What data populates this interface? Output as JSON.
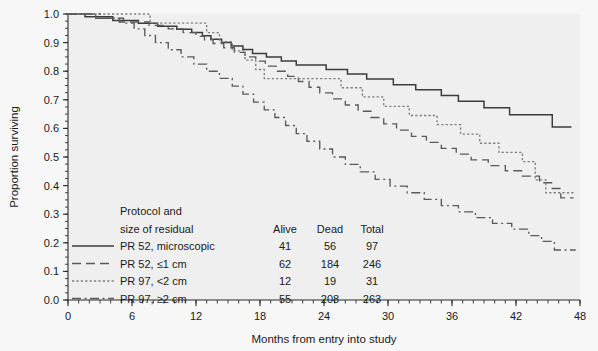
{
  "chart_data": {
    "type": "line",
    "title": "",
    "xlabel": "Months from entry into study",
    "ylabel": "Proportion surviving",
    "xlim": [
      0,
      48
    ],
    "ylim": [
      0.0,
      1.0
    ],
    "xticks": [
      0,
      6,
      12,
      18,
      24,
      30,
      36,
      42,
      48
    ],
    "xtick_labels": [
      "0",
      "6",
      "12",
      "18",
      "24",
      "30",
      "36",
      "42",
      "48"
    ],
    "x_minor_tick_interval": 1,
    "yticks": [
      0.0,
      0.1,
      0.2,
      0.3,
      0.4,
      0.5,
      0.6,
      0.7,
      0.8,
      0.9,
      1.0
    ],
    "ytick_labels": [
      "0.0",
      "0.1",
      "0.2",
      "0.3",
      "0.4",
      "0.5",
      "0.6",
      "0.7",
      "0.8",
      "0.9",
      "1.0"
    ],
    "y_minor_tick_interval": 0.025,
    "grid": false,
    "legend_position": "lower-left-inside",
    "background_color": "#f7f7f7",
    "plot_background_color": "#efefef",
    "series": [
      {
        "name": "PR 52, microscopic",
        "linestyle": "solid",
        "color": "#3c3c3c",
        "points": [
          [
            0,
            1.0
          ],
          [
            1.6,
            1.0
          ],
          [
            1.6,
            0.99
          ],
          [
            4.2,
            0.99
          ],
          [
            4.2,
            0.977
          ],
          [
            6.6,
            0.977
          ],
          [
            6.6,
            0.968
          ],
          [
            8.4,
            0.968
          ],
          [
            8.4,
            0.957
          ],
          [
            10.2,
            0.957
          ],
          [
            10.2,
            0.947
          ],
          [
            11.6,
            0.947
          ],
          [
            11.6,
            0.935
          ],
          [
            12.6,
            0.935
          ],
          [
            12.6,
            0.924
          ],
          [
            13.4,
            0.924
          ],
          [
            13.4,
            0.912
          ],
          [
            14.4,
            0.912
          ],
          [
            14.4,
            0.9
          ],
          [
            15.3,
            0.9
          ],
          [
            15.3,
            0.888
          ],
          [
            16.4,
            0.888
          ],
          [
            16.4,
            0.876
          ],
          [
            17.3,
            0.876
          ],
          [
            17.3,
            0.862
          ],
          [
            18.6,
            0.862
          ],
          [
            18.6,
            0.85
          ],
          [
            20.0,
            0.85
          ],
          [
            20.0,
            0.836
          ],
          [
            21.4,
            0.836
          ],
          [
            21.4,
            0.822
          ],
          [
            24.2,
            0.822
          ],
          [
            24.2,
            0.806
          ],
          [
            26.2,
            0.806
          ],
          [
            26.2,
            0.79
          ],
          [
            28.0,
            0.79
          ],
          [
            28.0,
            0.773
          ],
          [
            30.5,
            0.773
          ],
          [
            30.5,
            0.753
          ],
          [
            32.6,
            0.753
          ],
          [
            32.6,
            0.735
          ],
          [
            35.0,
            0.735
          ],
          [
            35.0,
            0.715
          ],
          [
            36.6,
            0.715
          ],
          [
            36.6,
            0.695
          ],
          [
            39.0,
            0.695
          ],
          [
            39.0,
            0.672
          ],
          [
            41.4,
            0.672
          ],
          [
            41.4,
            0.648
          ],
          [
            45.4,
            0.648
          ],
          [
            45.4,
            0.605
          ],
          [
            47.2,
            0.605
          ]
        ]
      },
      {
        "name": "PR 52, ≤1 cm",
        "linestyle": "dashed",
        "color": "#5a5a5a",
        "points": [
          [
            0,
            1.0
          ],
          [
            2.6,
            1.0
          ],
          [
            2.6,
            0.985
          ],
          [
            4.8,
            0.985
          ],
          [
            4.8,
            0.972
          ],
          [
            7.6,
            0.972
          ],
          [
            7.6,
            0.96
          ],
          [
            9.4,
            0.96
          ],
          [
            9.4,
            0.948
          ],
          [
            10.8,
            0.948
          ],
          [
            10.8,
            0.935
          ],
          [
            12.0,
            0.935
          ],
          [
            12.0,
            0.922
          ],
          [
            12.8,
            0.922
          ],
          [
            12.8,
            0.91
          ],
          [
            13.6,
            0.91
          ],
          [
            13.6,
            0.897
          ],
          [
            14.6,
            0.897
          ],
          [
            14.6,
            0.882
          ],
          [
            15.6,
            0.882
          ],
          [
            15.6,
            0.866
          ],
          [
            16.6,
            0.866
          ],
          [
            16.6,
            0.85
          ],
          [
            17.6,
            0.85
          ],
          [
            17.6,
            0.835
          ],
          [
            18.5,
            0.835
          ],
          [
            18.5,
            0.818
          ],
          [
            19.5,
            0.818
          ],
          [
            19.5,
            0.8
          ],
          [
            20.6,
            0.8
          ],
          [
            20.6,
            0.782
          ],
          [
            21.6,
            0.782
          ],
          [
            21.6,
            0.764
          ],
          [
            22.6,
            0.764
          ],
          [
            22.6,
            0.744
          ],
          [
            23.6,
            0.744
          ],
          [
            23.6,
            0.724
          ],
          [
            24.8,
            0.724
          ],
          [
            24.8,
            0.703
          ],
          [
            26.0,
            0.703
          ],
          [
            26.0,
            0.682
          ],
          [
            27.2,
            0.682
          ],
          [
            27.2,
            0.66
          ],
          [
            28.4,
            0.66
          ],
          [
            28.4,
            0.638
          ],
          [
            29.6,
            0.638
          ],
          [
            29.6,
            0.616
          ],
          [
            30.8,
            0.616
          ],
          [
            30.8,
            0.594
          ],
          [
            32.2,
            0.594
          ],
          [
            32.2,
            0.572
          ],
          [
            33.6,
            0.572
          ],
          [
            33.6,
            0.551
          ],
          [
            35.0,
            0.551
          ],
          [
            35.0,
            0.53
          ],
          [
            36.4,
            0.53
          ],
          [
            36.4,
            0.51
          ],
          [
            37.8,
            0.51
          ],
          [
            37.8,
            0.49
          ],
          [
            39.4,
            0.49
          ],
          [
            39.4,
            0.47
          ],
          [
            41.0,
            0.47
          ],
          [
            41.0,
            0.452
          ],
          [
            42.6,
            0.452
          ],
          [
            42.6,
            0.433
          ],
          [
            44.2,
            0.433
          ],
          [
            44.2,
            0.41
          ],
          [
            45.4,
            0.41
          ],
          [
            45.4,
            0.39
          ],
          [
            46.2,
            0.39
          ],
          [
            46.2,
            0.357
          ],
          [
            47.4,
            0.357
          ]
        ]
      },
      {
        "name": "PR 97, <2 cm",
        "linestyle": "dotted",
        "color": "#7d7d7d",
        "points": [
          [
            0,
            1.0
          ],
          [
            7.7,
            1.0
          ],
          [
            7.7,
            0.968
          ],
          [
            13.0,
            0.968
          ],
          [
            13.0,
            0.935
          ],
          [
            14.2,
            0.935
          ],
          [
            14.2,
            0.903
          ],
          [
            15.4,
            0.903
          ],
          [
            15.4,
            0.871
          ],
          [
            16.6,
            0.871
          ],
          [
            16.6,
            0.839
          ],
          [
            17.6,
            0.839
          ],
          [
            17.6,
            0.806
          ],
          [
            18.4,
            0.806
          ],
          [
            18.4,
            0.774
          ],
          [
            25.6,
            0.774
          ],
          [
            25.6,
            0.742
          ],
          [
            27.6,
            0.742
          ],
          [
            27.6,
            0.71
          ],
          [
            29.6,
            0.71
          ],
          [
            29.6,
            0.677
          ],
          [
            32.0,
            0.677
          ],
          [
            32.0,
            0.645
          ],
          [
            34.6,
            0.645
          ],
          [
            34.6,
            0.613
          ],
          [
            36.8,
            0.613
          ],
          [
            36.8,
            0.58
          ],
          [
            38.6,
            0.58
          ],
          [
            38.6,
            0.548
          ],
          [
            40.4,
            0.548
          ],
          [
            40.4,
            0.516
          ],
          [
            42.6,
            0.516
          ],
          [
            42.6,
            0.484
          ],
          [
            43.8,
            0.484
          ],
          [
            43.8,
            0.42
          ],
          [
            44.8,
            0.42
          ],
          [
            44.8,
            0.375
          ],
          [
            47.6,
            0.375
          ]
        ]
      },
      {
        "name": "PR 97, ≥2 cm",
        "linestyle": "dash-dot",
        "color": "#5a5a5a",
        "points": [
          [
            0,
            1.0
          ],
          [
            3.0,
            1.0
          ],
          [
            3.0,
            0.985
          ],
          [
            5.2,
            0.985
          ],
          [
            5.2,
            0.968
          ],
          [
            6.2,
            0.968
          ],
          [
            6.2,
            0.948
          ],
          [
            7.2,
            0.948
          ],
          [
            7.2,
            0.925
          ],
          [
            8.2,
            0.925
          ],
          [
            8.2,
            0.9
          ],
          [
            9.4,
            0.9
          ],
          [
            9.4,
            0.875
          ],
          [
            10.6,
            0.875
          ],
          [
            10.6,
            0.85
          ],
          [
            11.8,
            0.85
          ],
          [
            11.8,
            0.825
          ],
          [
            13.0,
            0.825
          ],
          [
            13.0,
            0.8
          ],
          [
            14.2,
            0.8
          ],
          [
            14.2,
            0.775
          ],
          [
            15.4,
            0.775
          ],
          [
            15.4,
            0.748
          ],
          [
            16.4,
            0.748
          ],
          [
            16.4,
            0.72
          ],
          [
            17.4,
            0.72
          ],
          [
            17.4,
            0.692
          ],
          [
            18.4,
            0.692
          ],
          [
            18.4,
            0.665
          ],
          [
            19.4,
            0.665
          ],
          [
            19.4,
            0.638
          ],
          [
            20.4,
            0.638
          ],
          [
            20.4,
            0.61
          ],
          [
            21.4,
            0.61
          ],
          [
            21.4,
            0.582
          ],
          [
            22.4,
            0.582
          ],
          [
            22.4,
            0.555
          ],
          [
            23.6,
            0.555
          ],
          [
            23.6,
            0.528
          ],
          [
            24.8,
            0.528
          ],
          [
            24.8,
            0.5
          ],
          [
            26.0,
            0.5
          ],
          [
            26.0,
            0.474
          ],
          [
            27.4,
            0.474
          ],
          [
            27.4,
            0.448
          ],
          [
            28.8,
            0.448
          ],
          [
            28.8,
            0.422
          ],
          [
            30.2,
            0.422
          ],
          [
            30.2,
            0.398
          ],
          [
            31.8,
            0.398
          ],
          [
            31.8,
            0.375
          ],
          [
            33.4,
            0.375
          ],
          [
            33.4,
            0.352
          ],
          [
            35.0,
            0.352
          ],
          [
            35.0,
            0.33
          ],
          [
            36.6,
            0.33
          ],
          [
            36.6,
            0.308
          ],
          [
            38.2,
            0.308
          ],
          [
            38.2,
            0.288
          ],
          [
            39.8,
            0.288
          ],
          [
            39.8,
            0.268
          ],
          [
            41.6,
            0.268
          ],
          [
            41.6,
            0.248
          ],
          [
            43.2,
            0.248
          ],
          [
            43.2,
            0.225
          ],
          [
            44.4,
            0.225
          ],
          [
            44.4,
            0.205
          ],
          [
            45.6,
            0.205
          ],
          [
            45.6,
            0.175
          ],
          [
            47.6,
            0.175
          ]
        ]
      }
    ]
  },
  "legend": {
    "header_line_1": "Protocol and",
    "header_line_2": "size of residual",
    "columns": [
      "Alive",
      "Dead",
      "Total"
    ],
    "rows": [
      {
        "label": "PR 52, microscopic",
        "alive": "41",
        "dead": "56",
        "total": "97",
        "linestyle": "solid"
      },
      {
        "label": "PR 52, ≤1 cm",
        "alive": "62",
        "dead": "184",
        "total": "246",
        "linestyle": "dashed"
      },
      {
        "label": "PR 97, <2 cm",
        "alive": "12",
        "dead": "19",
        "total": "31",
        "linestyle": "dotted"
      },
      {
        "label": "PR 97, ≥2 cm",
        "alive": "55",
        "dead": "208",
        "total": "263",
        "linestyle": "dash-dot"
      }
    ]
  }
}
